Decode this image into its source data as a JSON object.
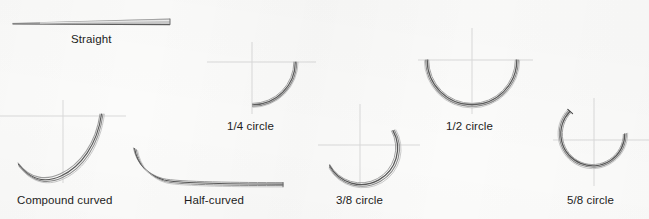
{
  "figure": {
    "kind": "needle-shape-diagram",
    "background_color": "#fbfbfa",
    "label_color": "#1c1c1c",
    "axis_color": "#d9d9d9",
    "needle_color_dark": "#4c4c4c",
    "needle_color_mid": "#7d7d7d",
    "needle_color_light": "#aeaeae"
  },
  "needles": [
    {
      "id": "straight",
      "label": "Straight",
      "label_x": 71,
      "label_y": 33,
      "shape": "straight-tapered-shaft",
      "has_axes": false,
      "arc_fraction": "0"
    },
    {
      "id": "compound-curved",
      "label": "Compound curved",
      "label_x": 17,
      "label_y": 194,
      "shape": "compound-curve",
      "has_axes": true,
      "axis_center_x": 63,
      "axis_center_y": 116,
      "arc_fraction": "compound"
    },
    {
      "id": "quarter-circle",
      "label": "1/4 circle",
      "label_x": 227,
      "label_y": 120,
      "shape": "arc",
      "has_axes": true,
      "axis_center_x": 252,
      "axis_center_y": 62,
      "radius": 43,
      "arc_fraction": "1/4"
    },
    {
      "id": "half-curved",
      "label": "Half-curved",
      "label_x": 184,
      "label_y": 194,
      "shape": "straight-shaft-with-hook",
      "has_axes": false,
      "arc_fraction": "half-curved"
    },
    {
      "id": "three-eighths-circle",
      "label": "3/8 circle",
      "label_x": 336,
      "label_y": 194,
      "shape": "arc",
      "has_axes": true,
      "axis_center_x": 360,
      "axis_center_y": 145,
      "radius": 35,
      "arc_fraction": "3/8"
    },
    {
      "id": "half-circle",
      "label": "1/2 circle",
      "label_x": 446,
      "label_y": 120,
      "shape": "arc",
      "has_axes": true,
      "axis_center_x": 472,
      "axis_center_y": 60,
      "radius": 45,
      "arc_fraction": "1/2"
    },
    {
      "id": "five-eighths-circle",
      "label": "5/8 circle",
      "label_x": 567,
      "label_y": 194,
      "shape": "arc",
      "has_axes": true,
      "axis_center_x": 594,
      "axis_center_y": 140,
      "radius": 33,
      "arc_fraction": "5/8"
    }
  ]
}
